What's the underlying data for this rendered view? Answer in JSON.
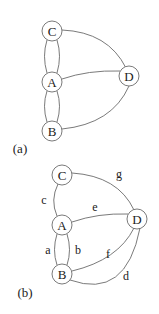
{
  "figures": [
    {
      "caption": "(a)",
      "nodes": [
        {
          "id": "C",
          "label": "C"
        },
        {
          "id": "A",
          "label": "A"
        },
        {
          "id": "D",
          "label": "D"
        },
        {
          "id": "B",
          "label": "B"
        }
      ],
      "edges": [
        {
          "from": "C",
          "to": "A",
          "label": ""
        },
        {
          "from": "C",
          "to": "A",
          "label": ""
        },
        {
          "from": "A",
          "to": "B",
          "label": ""
        },
        {
          "from": "A",
          "to": "B",
          "label": ""
        },
        {
          "from": "C",
          "to": "D",
          "label": ""
        },
        {
          "from": "A",
          "to": "D",
          "label": ""
        },
        {
          "from": "B",
          "to": "D",
          "label": ""
        }
      ]
    },
    {
      "caption": "(b)",
      "nodes": [
        {
          "id": "C",
          "label": "C"
        },
        {
          "id": "A",
          "label": "A"
        },
        {
          "id": "D",
          "label": "D"
        },
        {
          "id": "B",
          "label": "B"
        }
      ],
      "edges": [
        {
          "from": "A",
          "to": "C",
          "label": "c"
        },
        {
          "from": "C",
          "to": "D",
          "label": "g"
        },
        {
          "from": "A",
          "to": "D",
          "label": "e"
        },
        {
          "from": "A",
          "to": "B",
          "label": "a"
        },
        {
          "from": "A",
          "to": "B",
          "label": "b"
        },
        {
          "from": "B",
          "to": "D",
          "label": "f"
        },
        {
          "from": "B",
          "to": "D",
          "label": "d"
        }
      ]
    }
  ]
}
